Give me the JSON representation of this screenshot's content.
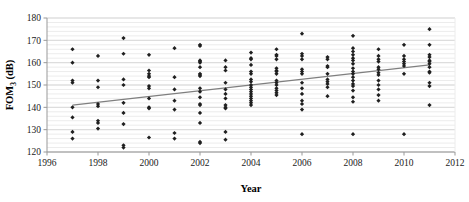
{
  "chart_data": {
    "type": "scatter",
    "title": "",
    "xlabel": "Year",
    "ylabel": "FOM3 (dB)",
    "ylabel_base": "FOM",
    "ylabel_sub": "3",
    "ylabel_unit": " (dB)",
    "xlim": [
      1996,
      2012
    ],
    "ylim": [
      120,
      180
    ],
    "xticks": [
      1996,
      1998,
      2000,
      2002,
      2004,
      2006,
      2008,
      2010,
      2012
    ],
    "yticks": [
      120,
      130,
      140,
      150,
      160,
      170,
      180
    ],
    "xtick_labels": [
      "1996",
      "1998",
      "2000",
      "2002",
      "2004",
      "2006",
      "2008",
      "2010",
      "2012"
    ],
    "ytick_labels": [
      "120",
      "130",
      "140",
      "150",
      "160",
      "170",
      "180"
    ],
    "grid": "horizontal-minor-2dB",
    "minor_gridline_step": 2,
    "legend": "none",
    "marker_color": "#1f1f1f",
    "marker_shape": "diamond",
    "trendline": {
      "color": "#7f7f7f",
      "x_start": 1997,
      "y_start": 141.0,
      "x_end": 2011,
      "y_end": 159.0
    },
    "points": [
      {
        "x": 1997,
        "y": 166.0
      },
      {
        "x": 1997,
        "y": 160.0
      },
      {
        "x": 1997,
        "y": 152.0
      },
      {
        "x": 1997,
        "y": 151.0
      },
      {
        "x": 1997,
        "y": 140.0
      },
      {
        "x": 1997,
        "y": 135.5
      },
      {
        "x": 1997,
        "y": 129.0
      },
      {
        "x": 1997,
        "y": 126.0
      },
      {
        "x": 1998,
        "y": 163.0
      },
      {
        "x": 1998,
        "y": 152.0
      },
      {
        "x": 1998,
        "y": 149.0
      },
      {
        "x": 1998,
        "y": 141.5
      },
      {
        "x": 1998,
        "y": 140.5
      },
      {
        "x": 1998,
        "y": 134.0
      },
      {
        "x": 1998,
        "y": 133.0
      },
      {
        "x": 1998,
        "y": 130.5
      },
      {
        "x": 1999,
        "y": 171.0
      },
      {
        "x": 1999,
        "y": 164.0
      },
      {
        "x": 1999,
        "y": 152.5
      },
      {
        "x": 1999,
        "y": 150.0
      },
      {
        "x": 1999,
        "y": 142.0
      },
      {
        "x": 1999,
        "y": 137.5
      },
      {
        "x": 1999,
        "y": 132.5
      },
      {
        "x": 1999,
        "y": 123.0
      },
      {
        "x": 1999,
        "y": 122.0
      },
      {
        "x": 2000,
        "y": 163.5
      },
      {
        "x": 2000,
        "y": 156.5
      },
      {
        "x": 2000,
        "y": 155.0
      },
      {
        "x": 2000,
        "y": 154.0
      },
      {
        "x": 2000,
        "y": 153.5
      },
      {
        "x": 2000,
        "y": 149.5
      },
      {
        "x": 2000,
        "y": 148.5
      },
      {
        "x": 2000,
        "y": 144.0
      },
      {
        "x": 2000,
        "y": 140.0
      },
      {
        "x": 2000,
        "y": 139.5
      },
      {
        "x": 2000,
        "y": 126.5
      },
      {
        "x": 2001,
        "y": 166.5
      },
      {
        "x": 2001,
        "y": 153.5
      },
      {
        "x": 2001,
        "y": 148.0
      },
      {
        "x": 2001,
        "y": 143.0
      },
      {
        "x": 2001,
        "y": 139.0
      },
      {
        "x": 2001,
        "y": 128.5
      },
      {
        "x": 2001,
        "y": 126.0
      },
      {
        "x": 2002,
        "y": 168.0
      },
      {
        "x": 2002,
        "y": 167.5
      },
      {
        "x": 2002,
        "y": 161.0
      },
      {
        "x": 2002,
        "y": 160.5
      },
      {
        "x": 2002,
        "y": 160.0
      },
      {
        "x": 2002,
        "y": 158.0
      },
      {
        "x": 2002,
        "y": 155.0
      },
      {
        "x": 2002,
        "y": 154.5
      },
      {
        "x": 2002,
        "y": 154.0
      },
      {
        "x": 2002,
        "y": 148.5
      },
      {
        "x": 2002,
        "y": 147.0
      },
      {
        "x": 2002,
        "y": 144.5
      },
      {
        "x": 2002,
        "y": 141.5
      },
      {
        "x": 2002,
        "y": 141.0
      },
      {
        "x": 2002,
        "y": 137.5
      },
      {
        "x": 2002,
        "y": 133.0
      },
      {
        "x": 2002,
        "y": 124.5
      },
      {
        "x": 2002,
        "y": 124.0
      },
      {
        "x": 2003,
        "y": 161.0
      },
      {
        "x": 2003,
        "y": 158.0
      },
      {
        "x": 2003,
        "y": 156.5
      },
      {
        "x": 2003,
        "y": 151.0
      },
      {
        "x": 2003,
        "y": 148.0
      },
      {
        "x": 2003,
        "y": 146.0
      },
      {
        "x": 2003,
        "y": 144.0
      },
      {
        "x": 2003,
        "y": 141.0
      },
      {
        "x": 2003,
        "y": 140.0
      },
      {
        "x": 2003,
        "y": 139.5
      },
      {
        "x": 2003,
        "y": 129.0
      },
      {
        "x": 2003,
        "y": 125.5
      },
      {
        "x": 2004,
        "y": 164.5
      },
      {
        "x": 2004,
        "y": 162.0
      },
      {
        "x": 2004,
        "y": 161.5
      },
      {
        "x": 2004,
        "y": 159.0
      },
      {
        "x": 2004,
        "y": 156.0
      },
      {
        "x": 2004,
        "y": 155.0
      },
      {
        "x": 2004,
        "y": 152.5
      },
      {
        "x": 2004,
        "y": 151.5
      },
      {
        "x": 2004,
        "y": 150.0
      },
      {
        "x": 2004,
        "y": 149.0
      },
      {
        "x": 2004,
        "y": 148.0
      },
      {
        "x": 2004,
        "y": 147.0
      },
      {
        "x": 2004,
        "y": 146.0
      },
      {
        "x": 2004,
        "y": 145.0
      },
      {
        "x": 2004,
        "y": 144.0
      },
      {
        "x": 2004,
        "y": 143.0
      },
      {
        "x": 2004,
        "y": 142.0
      },
      {
        "x": 2004,
        "y": 141.0
      },
      {
        "x": 2005,
        "y": 166.0
      },
      {
        "x": 2005,
        "y": 163.5
      },
      {
        "x": 2005,
        "y": 163.0
      },
      {
        "x": 2005,
        "y": 161.5
      },
      {
        "x": 2005,
        "y": 157.5
      },
      {
        "x": 2005,
        "y": 156.5
      },
      {
        "x": 2005,
        "y": 156.0
      },
      {
        "x": 2005,
        "y": 155.0
      },
      {
        "x": 2005,
        "y": 152.0
      },
      {
        "x": 2005,
        "y": 151.0
      },
      {
        "x": 2005,
        "y": 150.0
      },
      {
        "x": 2005,
        "y": 148.5
      },
      {
        "x": 2005,
        "y": 147.5
      },
      {
        "x": 2005,
        "y": 146.5
      },
      {
        "x": 2005,
        "y": 145.5
      },
      {
        "x": 2006,
        "y": 173.0
      },
      {
        "x": 2006,
        "y": 164.0
      },
      {
        "x": 2006,
        "y": 163.0
      },
      {
        "x": 2006,
        "y": 161.5
      },
      {
        "x": 2006,
        "y": 157.0
      },
      {
        "x": 2006,
        "y": 156.0
      },
      {
        "x": 2006,
        "y": 155.0
      },
      {
        "x": 2006,
        "y": 151.0
      },
      {
        "x": 2006,
        "y": 148.5
      },
      {
        "x": 2006,
        "y": 146.0
      },
      {
        "x": 2006,
        "y": 143.0
      },
      {
        "x": 2006,
        "y": 141.5
      },
      {
        "x": 2006,
        "y": 139.0
      },
      {
        "x": 2006,
        "y": 128.0
      },
      {
        "x": 2007,
        "y": 162.5
      },
      {
        "x": 2007,
        "y": 161.5
      },
      {
        "x": 2007,
        "y": 158.5
      },
      {
        "x": 2007,
        "y": 158.0
      },
      {
        "x": 2007,
        "y": 155.0
      },
      {
        "x": 2007,
        "y": 152.5
      },
      {
        "x": 2007,
        "y": 151.5
      },
      {
        "x": 2007,
        "y": 150.5
      },
      {
        "x": 2007,
        "y": 149.0
      },
      {
        "x": 2007,
        "y": 145.0
      },
      {
        "x": 2008,
        "y": 172.0
      },
      {
        "x": 2008,
        "y": 166.5
      },
      {
        "x": 2008,
        "y": 165.0
      },
      {
        "x": 2008,
        "y": 163.5
      },
      {
        "x": 2008,
        "y": 162.0
      },
      {
        "x": 2008,
        "y": 161.0
      },
      {
        "x": 2008,
        "y": 159.5
      },
      {
        "x": 2008,
        "y": 157.5
      },
      {
        "x": 2008,
        "y": 156.0
      },
      {
        "x": 2008,
        "y": 155.0
      },
      {
        "x": 2008,
        "y": 153.5
      },
      {
        "x": 2008,
        "y": 152.0
      },
      {
        "x": 2008,
        "y": 150.5
      },
      {
        "x": 2008,
        "y": 149.5
      },
      {
        "x": 2008,
        "y": 147.5
      },
      {
        "x": 2008,
        "y": 144.5
      },
      {
        "x": 2008,
        "y": 142.5
      },
      {
        "x": 2008,
        "y": 128.0
      },
      {
        "x": 2009,
        "y": 166.0
      },
      {
        "x": 2009,
        "y": 163.0
      },
      {
        "x": 2009,
        "y": 161.5
      },
      {
        "x": 2009,
        "y": 160.5
      },
      {
        "x": 2009,
        "y": 158.0
      },
      {
        "x": 2009,
        "y": 157.0
      },
      {
        "x": 2009,
        "y": 155.5
      },
      {
        "x": 2009,
        "y": 154.5
      },
      {
        "x": 2009,
        "y": 152.0
      },
      {
        "x": 2009,
        "y": 150.0
      },
      {
        "x": 2009,
        "y": 148.0
      },
      {
        "x": 2009,
        "y": 145.5
      },
      {
        "x": 2009,
        "y": 143.0
      },
      {
        "x": 2010,
        "y": 168.0
      },
      {
        "x": 2010,
        "y": 163.0
      },
      {
        "x": 2010,
        "y": 161.5
      },
      {
        "x": 2010,
        "y": 160.5
      },
      {
        "x": 2010,
        "y": 159.5
      },
      {
        "x": 2010,
        "y": 158.5
      },
      {
        "x": 2010,
        "y": 155.0
      },
      {
        "x": 2010,
        "y": 128.0
      },
      {
        "x": 2011,
        "y": 175.0
      },
      {
        "x": 2011,
        "y": 168.0
      },
      {
        "x": 2011,
        "y": 163.5
      },
      {
        "x": 2011,
        "y": 162.5
      },
      {
        "x": 2011,
        "y": 161.0
      },
      {
        "x": 2011,
        "y": 160.5
      },
      {
        "x": 2011,
        "y": 159.5
      },
      {
        "x": 2011,
        "y": 158.0
      },
      {
        "x": 2011,
        "y": 156.0
      },
      {
        "x": 2011,
        "y": 155.5
      },
      {
        "x": 2011,
        "y": 151.0
      },
      {
        "x": 2011,
        "y": 149.5
      },
      {
        "x": 2011,
        "y": 141.0
      }
    ]
  },
  "axes": {
    "plot_left": 47,
    "plot_right": 455,
    "plot_top": 18,
    "plot_bottom": 152,
    "axis_color": "#999999",
    "gridline_color": "#d9d9d9",
    "minor_gridline_color": "#ececec"
  }
}
